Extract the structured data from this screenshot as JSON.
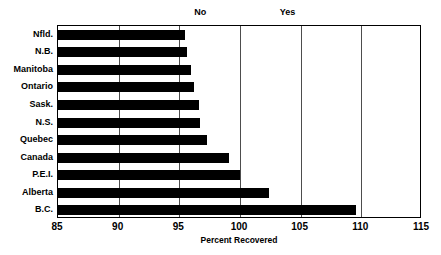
{
  "chart_data": {
    "type": "bar",
    "orientation": "horizontal",
    "title": "",
    "xlabel": "Percent Recovered",
    "ylabel": "",
    "xlim": [
      85,
      115
    ],
    "xticks": [
      85,
      90,
      95,
      100,
      105,
      110,
      115
    ],
    "xtick_labels": [
      "85",
      "90",
      "95",
      "100",
      "105",
      "110",
      "115"
    ],
    "grid": true,
    "grid_axis": "x",
    "legend": null,
    "bar_color": "#000000",
    "categories": [
      "Nfld.",
      "N.B.",
      "Manitoba",
      "Ontario",
      "Sask.",
      "N.S.",
      "Quebec",
      "Canada",
      "P.E.I.",
      "Alberta",
      "B.C."
    ],
    "values": [
      95.5,
      95.6,
      96.0,
      96.2,
      96.6,
      96.7,
      97.3,
      99.1,
      100.0,
      102.4,
      109.6
    ],
    "annotations": [
      {
        "text": "No",
        "x": 96.8,
        "position": "above-plot"
      },
      {
        "text": "Yes",
        "x": 104.0,
        "position": "above-plot"
      }
    ]
  }
}
